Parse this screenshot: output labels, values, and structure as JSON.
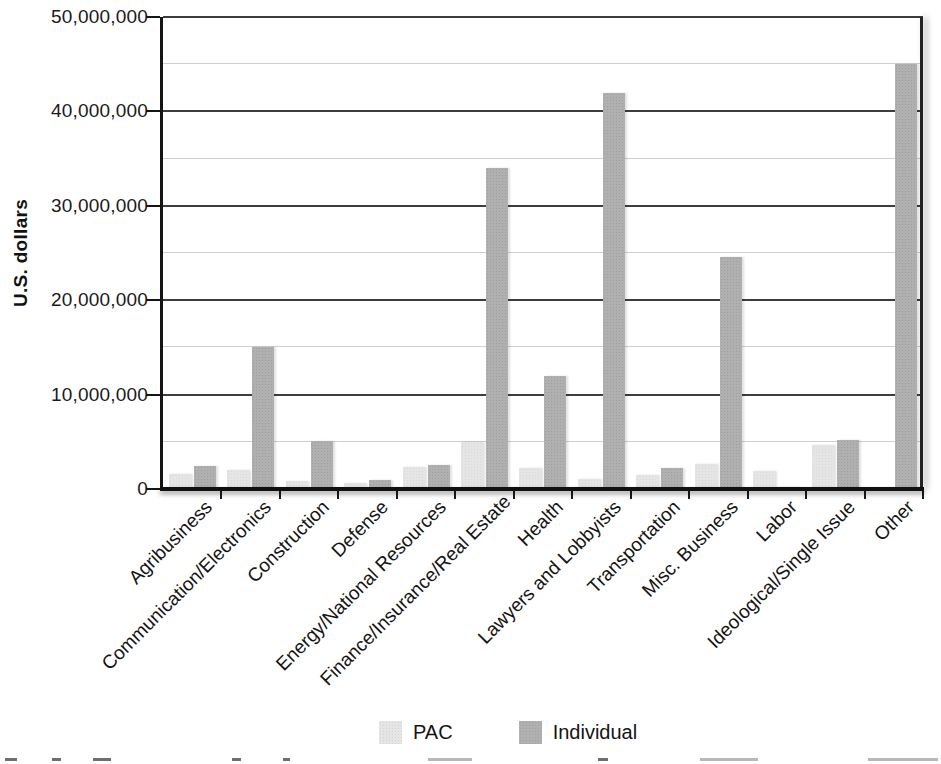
{
  "figure": {
    "y_axis_title": "U.S. dollars",
    "legend": {
      "position": "bottom-center",
      "items": [
        "PAC",
        "Individual"
      ]
    }
  },
  "chart_data": {
    "type": "bar",
    "title": "",
    "xlabel": "",
    "ylabel": "U.S. dollars",
    "legend_position": "bottom",
    "grid": "horizontal; dark major gridlines every 10,000,000; light minor gridlines every 5,000,000",
    "ylim": [
      0,
      50000000
    ],
    "y_ticks": [
      {
        "value": 0,
        "label": "0"
      },
      {
        "value": 10000000,
        "label": "10,000,000"
      },
      {
        "value": 20000000,
        "label": "20,000,000"
      },
      {
        "value": 30000000,
        "label": "30,000,000"
      },
      {
        "value": 40000000,
        "label": "40,000,000"
      },
      {
        "value": 50000000,
        "label": "50,000,000"
      }
    ],
    "minor_gridlines": [
      5000000,
      15000000,
      25000000,
      35000000,
      45000000
    ],
    "categories": [
      "Agribusiness",
      "Communication/Electronics",
      "Construction",
      "Defense",
      "Energy/National Resources",
      "Finance/Insurance/Real Estate",
      "Health",
      "Lawyers and Lobbyists",
      "Transportation",
      "Misc. Business",
      "Labor",
      "Ideological/Single Issue",
      "Other"
    ],
    "series": [
      {
        "name": "PAC",
        "color": "#e5e5e5",
        "values": [
          1600000,
          2000000,
          900000,
          600000,
          2300000,
          5000000,
          2200000,
          1100000,
          1500000,
          2600000,
          1900000,
          4700000,
          100000
        ]
      },
      {
        "name": "Individual",
        "color": "#b0b0b0",
        "values": [
          2400000,
          15000000,
          5100000,
          1000000,
          2500000,
          34000000,
          12000000,
          42000000,
          2200000,
          24600000,
          200000,
          5200000,
          45000000
        ]
      }
    ]
  }
}
